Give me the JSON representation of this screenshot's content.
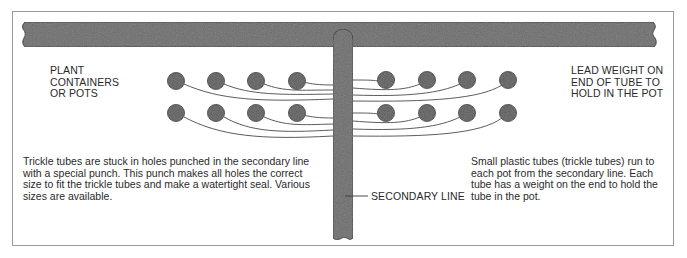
{
  "diagram": {
    "labels": {
      "plant_containers": "PLANT\nCONTAINERS\nOR POTS",
      "lead_weight": "LEAD WEIGHT ON\nEND OF TUBE TO\nHOLD IN THE POT",
      "secondary_line": "SECONDARY LINE"
    },
    "captions": {
      "left": "Trickle tubes are stuck in holes punched in the secondary line with a special punch. This punch makes all holes the correct size to fit the trickle tubes and make a watertight seal. Various sizes are available.",
      "right": "Small plastic tubes (trickle tubes) run to each pot from the secondary line. Each tube has a weight on the end to hold the tube in the pot."
    },
    "components": {
      "main_line": "horizontal main pipe",
      "secondary_line": "vertical secondary line",
      "pots_per_side": 8,
      "pot_rows": 2,
      "pots_total": 16
    },
    "colors": {
      "pipe": "#6e6e6e",
      "pot": "#5f5f5f",
      "outline": "#3a3a3a",
      "tube": "#4a4a4a",
      "frame": "#9a9a9a"
    }
  }
}
